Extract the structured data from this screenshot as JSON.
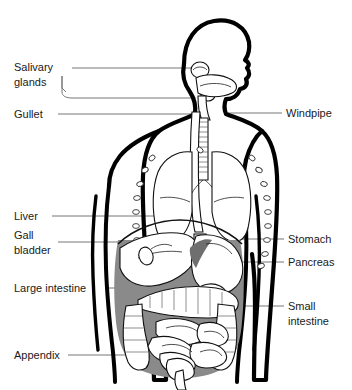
{
  "figure": {
    "background_color": "#ffffff",
    "line_color": "#000000",
    "leader_color": "#777777",
    "shade_color": "#8a8a8a",
    "text_color": "#1a1a1a"
  },
  "labels_left": [
    {
      "id": "salivary-glands",
      "line1": "Salivary",
      "line2": "glands"
    },
    {
      "id": "gullet",
      "line1": "Gullet",
      "line2": ""
    },
    {
      "id": "liver",
      "line1": "Liver",
      "line2": ""
    },
    {
      "id": "gall-bladder",
      "line1": "Gall",
      "line2": "bladder"
    },
    {
      "id": "large-intestine",
      "line1": "Large intestine",
      "line2": ""
    },
    {
      "id": "appendix",
      "line1": "Appendix",
      "line2": ""
    }
  ],
  "labels_right": [
    {
      "id": "windpipe",
      "line1": "Windpipe",
      "line2": ""
    },
    {
      "id": "stomach",
      "line1": "Stomach",
      "line2": ""
    },
    {
      "id": "pancreas",
      "line1": "Pancreas",
      "line2": ""
    },
    {
      "id": "small-intestine",
      "line1": "Small",
      "line2": "intestine"
    }
  ]
}
